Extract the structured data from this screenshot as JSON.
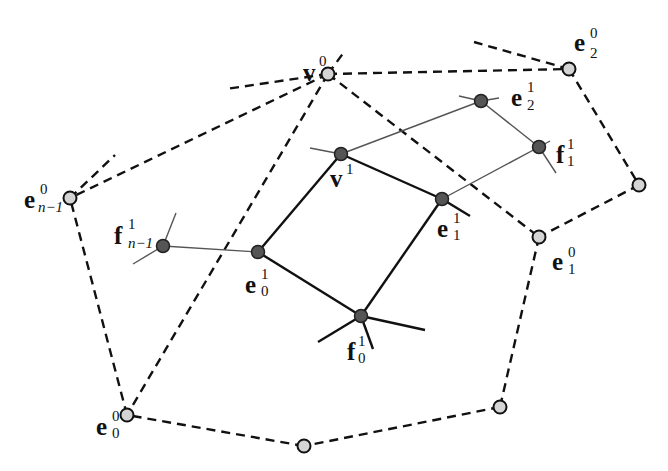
{
  "figure": {
    "colors": {
      "coarse_vertex_fill": "#d4d4d4",
      "fine_vertex_fill": "#555555",
      "stroke": "#111111",
      "thin_edge": "#555555",
      "background": "#ffffff"
    }
  },
  "labels": {
    "v0": {
      "base": "v",
      "sup": "0",
      "sub": ""
    },
    "v1": {
      "base": "v",
      "sup": "1",
      "sub": ""
    },
    "e0_0": {
      "base": "e",
      "sup": "0",
      "sub": "0"
    },
    "e1_0": {
      "base": "e",
      "sup": "0",
      "sub": "1"
    },
    "e2_0": {
      "base": "e",
      "sup": "0",
      "sub": "2"
    },
    "en1_0": {
      "base": "e",
      "sup": "0",
      "sub": "n−1"
    },
    "e0_1": {
      "base": "e",
      "sup": "1",
      "sub": "0"
    },
    "e1_1": {
      "base": "e",
      "sup": "1",
      "sub": "1"
    },
    "e2_1": {
      "base": "e",
      "sup": "1",
      "sub": "2"
    },
    "f0_1": {
      "base": "f",
      "sup": "1",
      "sub": "0"
    },
    "f1_1": {
      "base": "f",
      "sup": "1",
      "sub": "1"
    },
    "fn1_1": {
      "base": "f",
      "sup": "1",
      "sub": "n−1"
    }
  },
  "nodes": {
    "coarse": [
      {
        "id": "v0",
        "x": 328,
        "y": 74
      },
      {
        "id": "e2_0",
        "x": 569,
        "y": 69
      },
      {
        "id": "right",
        "x": 639,
        "y": 185
      },
      {
        "id": "e1_0",
        "x": 539,
        "y": 237
      },
      {
        "id": "bottom_right",
        "x": 500,
        "y": 407
      },
      {
        "id": "bottom_mid",
        "x": 304,
        "y": 446
      },
      {
        "id": "e0_0",
        "x": 127,
        "y": 415
      },
      {
        "id": "en1_0",
        "x": 70,
        "y": 198
      }
    ],
    "fine": [
      {
        "id": "v1",
        "x": 341,
        "y": 154
      },
      {
        "id": "e2_1",
        "x": 481,
        "y": 101
      },
      {
        "id": "f1_1",
        "x": 539,
        "y": 147
      },
      {
        "id": "e1_1",
        "x": 442,
        "y": 199
      },
      {
        "id": "f0_1",
        "x": 361,
        "y": 316
      },
      {
        "id": "e0_1",
        "x": 258,
        "y": 252
      },
      {
        "id": "fn1_1",
        "x": 163,
        "y": 246
      }
    ]
  }
}
